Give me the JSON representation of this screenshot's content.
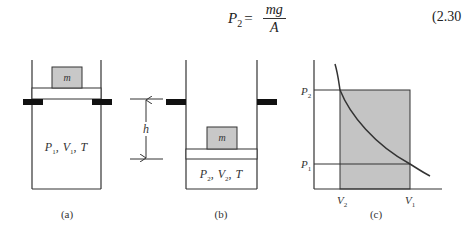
{
  "equation": {
    "lhs_symbol": "P",
    "lhs_subscript": "2",
    "equals": "=",
    "numerator": "mg",
    "denominator": "A",
    "number": "(2.30"
  },
  "panels": {
    "a": {
      "caption": "(a)",
      "mass_label": "m",
      "state": {
        "P": "P",
        "P_sub": "1",
        "V": "V",
        "V_sub": "1",
        "T": "T",
        "sep": ","
      }
    },
    "b": {
      "caption": "(b)",
      "mass_label": "m",
      "state": {
        "P": "P",
        "P_sub": "2",
        "V": "V",
        "V_sub": "2",
        "T": "T",
        "sep": ","
      }
    },
    "dimension": {
      "label": "h"
    },
    "c": {
      "caption": "(c)",
      "y_ticks": [
        {
          "symbol": "P",
          "sub": "2"
        },
        {
          "symbol": "P",
          "sub": "1"
        }
      ],
      "x_ticks": [
        {
          "symbol": "V",
          "sub": "2"
        },
        {
          "symbol": "V",
          "sub": "1"
        }
      ]
    }
  },
  "colors": {
    "line": "#333333",
    "mass_fill": "#c8c8c8",
    "stop_fill": "#111111",
    "shade_fill": "#c4c4c4"
  }
}
